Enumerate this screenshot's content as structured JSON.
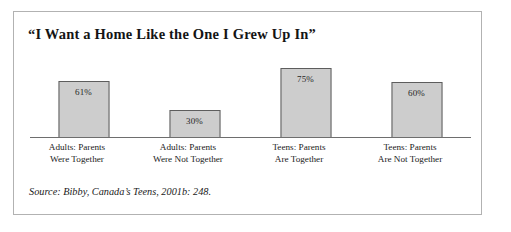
{
  "figure": {
    "title": "“I Want a Home Like the One I Grew Up In”",
    "source_note": "Source: Bibby, Canada’s Teens, 2001b: 248.",
    "frame_color": "#b2b2b2",
    "bar_fill": "#cdcdcd",
    "bar_border": "#5d5d5d",
    "axis_color": "#6e6e6e"
  },
  "chart_data": {
    "type": "bar",
    "title": "“I Want a Home Like the One I Grew Up In”",
    "xlabel": "",
    "ylabel": "",
    "ylim": [
      0,
      100
    ],
    "grid": false,
    "legend": "none",
    "categories": [
      "Adults: Parents Were Together",
      "Adults: Parents Were Not Together",
      "Teens: Parents Are Together",
      "Teens: Parents Are Not Together"
    ],
    "category_lines": [
      [
        "Adults: Parents",
        "Were Together"
      ],
      [
        "Adults: Parents",
        "Were Not Together"
      ],
      [
        "Teens: Parents",
        "Are Together"
      ],
      [
        "Teens: Parents",
        "Are Not Together"
      ]
    ],
    "values": [
      61,
      30,
      75,
      60
    ],
    "data_labels": [
      "61%",
      "30%",
      "75%",
      "60%"
    ],
    "annotations": [
      "Source: Bibby, Canada’s Teens, 2001b: 248."
    ]
  }
}
